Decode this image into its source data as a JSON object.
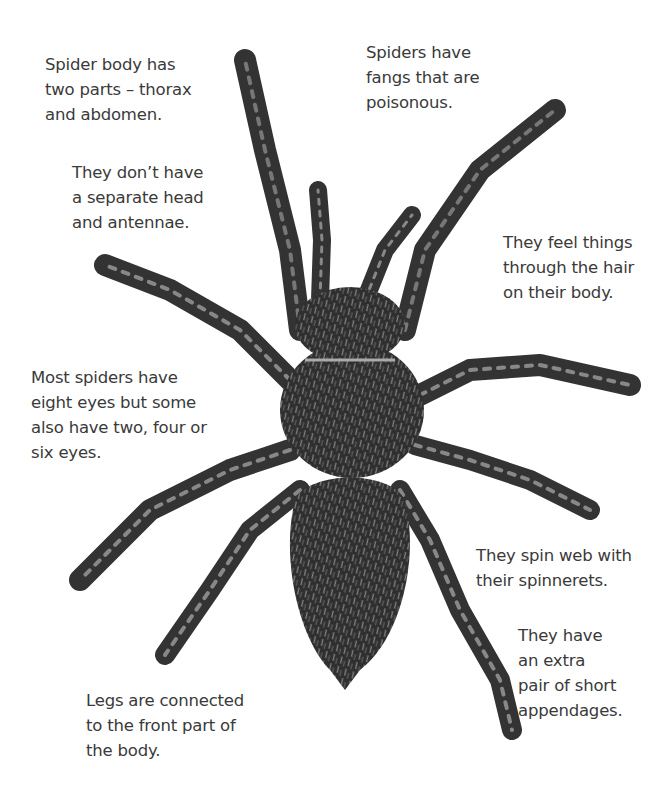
{
  "diagram": {
    "labels": [
      {
        "id": "body-parts",
        "lines": [
          "Spider body has",
          "two parts – thorax",
          "and abdomen."
        ]
      },
      {
        "id": "no-head",
        "lines": [
          "They don’t have",
          "a separate head",
          "and antennae."
        ]
      },
      {
        "id": "fangs",
        "lines": [
          "Spiders have",
          "fangs that are",
          "poisonous."
        ]
      },
      {
        "id": "hair",
        "lines": [
          "They feel things",
          "through the hair",
          "on their body."
        ]
      },
      {
        "id": "eyes",
        "lines": [
          "Most spiders have",
          "eight eyes but some",
          "also have two, four or",
          "six eyes."
        ]
      },
      {
        "id": "spinnerets",
        "lines": [
          "They spin web with",
          "their spinnerets."
        ]
      },
      {
        "id": "appendages",
        "lines": [
          "They have",
          "an extra",
          "pair of short",
          "appendages."
        ]
      },
      {
        "id": "legs",
        "lines": [
          "Legs are connected",
          "to the front part of",
          "the body."
        ]
      }
    ]
  },
  "colors": {
    "text": "#3a3a3a",
    "spider_dark": "#2b2b2b",
    "spider_mid": "#555555",
    "spider_light": "#9a9a9a",
    "background": "#ffffff"
  }
}
